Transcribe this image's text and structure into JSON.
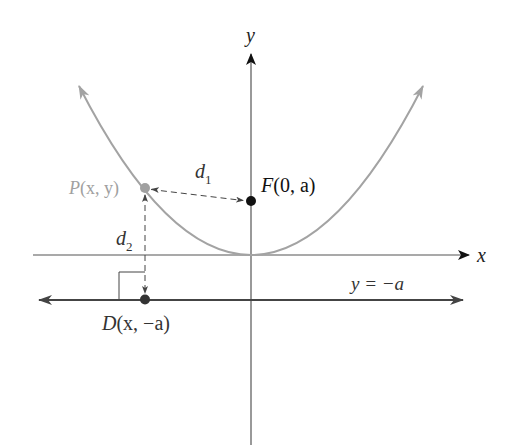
{
  "diagram": {
    "type": "parabola-focus-directrix",
    "axes": {
      "x_label": "x",
      "y_label": "y"
    },
    "points": {
      "P": {
        "name": "P",
        "coords": "(x, y)",
        "color": "#a0a0a0"
      },
      "F": {
        "name": "F",
        "coords": "(0, a)",
        "color": "#111111"
      },
      "D": {
        "name": "D",
        "coords": "(x, −a)",
        "color": "#333333"
      }
    },
    "distances": {
      "d1": {
        "base": "d",
        "sub": "1"
      },
      "d2": {
        "base": "d",
        "sub": "2"
      }
    },
    "directrix_label": "y = −a",
    "colors": {
      "parabola": "#a3a3a3",
      "axis": "#555555",
      "directrix": "#444444",
      "text": "#222222"
    }
  }
}
